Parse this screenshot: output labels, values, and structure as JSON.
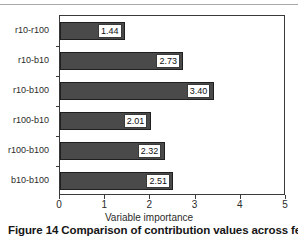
{
  "caption": {
    "prefix": "Figure 14",
    "text": "Figure 14 Comparison of contribution values across features"
  },
  "chart_data": {
    "type": "bar",
    "orientation": "horizontal",
    "title": "",
    "xlabel": "Variable importance",
    "ylabel": "",
    "xlim": [
      0,
      5
    ],
    "xticks": [
      "0",
      "1",
      "2",
      "3",
      "4",
      "5"
    ],
    "grid": false,
    "legend": null,
    "bar_color": "#4a4a4a",
    "bar_edge_color": "#1f1f1f",
    "categories": [
      "r10-r100",
      "r10-b10",
      "r10-b100",
      "r100-b10",
      "r100-b100",
      "b10-b100"
    ],
    "values": [
      1.44,
      2.73,
      3.4,
      2.01,
      2.32,
      2.51
    ],
    "value_labels": [
      "1.44",
      "2.73",
      "3.40",
      "2.01",
      "2.32",
      "2.51"
    ]
  }
}
